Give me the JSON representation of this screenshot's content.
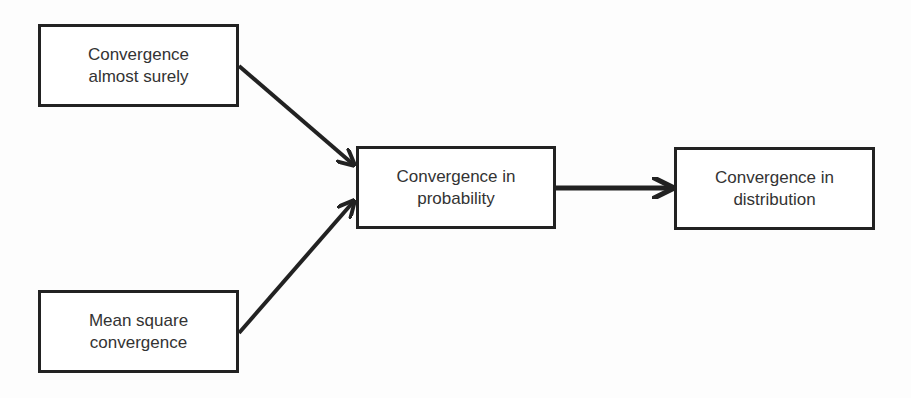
{
  "diagram": {
    "type": "flowchart",
    "direction": "left-to-right",
    "colors": {
      "stroke": "#222222",
      "text": "#333333",
      "background": "#ffffff"
    },
    "nodes": [
      {
        "id": "as",
        "line1": "Convergence",
        "line2": "almost surely"
      },
      {
        "id": "ms",
        "line1": "Mean square",
        "line2": "convergence"
      },
      {
        "id": "prob",
        "line1": "Convergence in",
        "line2": "probability"
      },
      {
        "id": "dist",
        "line1": "Convergence in",
        "line2": "distribution"
      }
    ],
    "edges": [
      {
        "from": "as",
        "to": "prob"
      },
      {
        "from": "ms",
        "to": "prob"
      },
      {
        "from": "prob",
        "to": "dist"
      }
    ]
  }
}
